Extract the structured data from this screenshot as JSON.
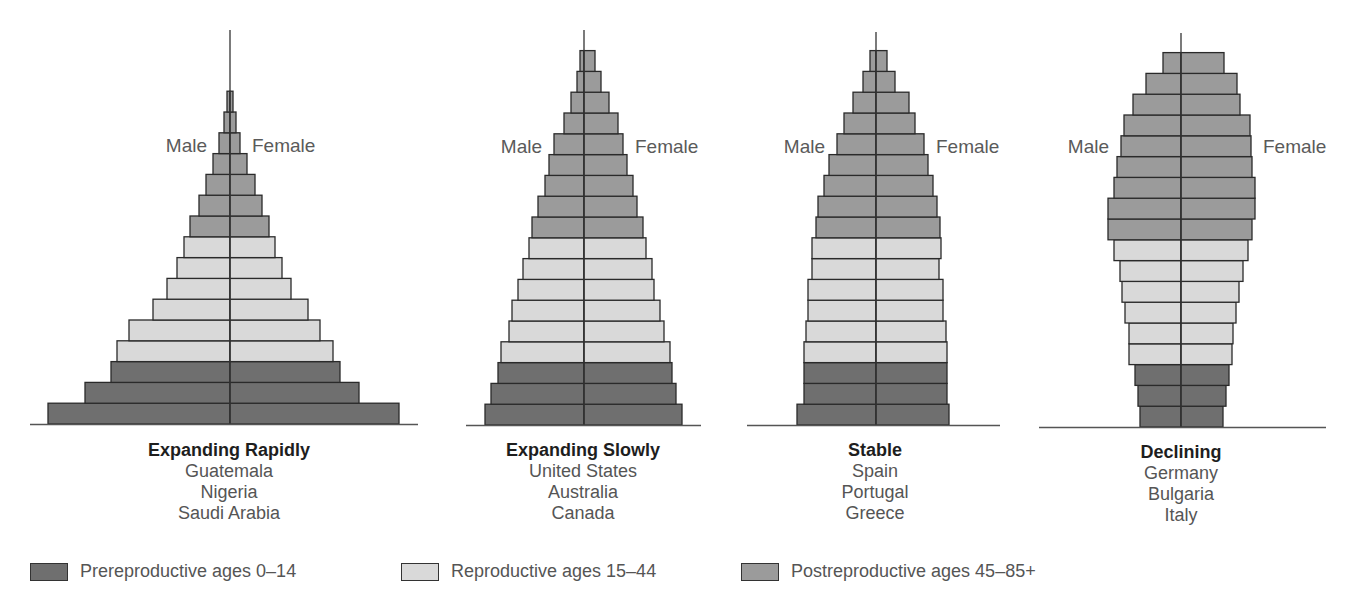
{
  "colors": {
    "prereproductive": "#6f6f6f",
    "reproductive": "#d9d9d9",
    "postreproductive": "#9b9b9b",
    "outline": "#2a2a2a",
    "axis": "#333333"
  },
  "labels": {
    "male": "Male",
    "female": "Female"
  },
  "legend": [
    {
      "key": "prereproductive",
      "label": "Prereproductive ages 0–14"
    },
    {
      "key": "reproductive",
      "label": "Reproductive ages 15–44"
    },
    {
      "key": "postreproductive",
      "label": "Postreproductive ages 45–85+"
    }
  ],
  "pyramids": [
    {
      "title": "Expanding Rapidly",
      "countries": [
        "Guatemala",
        "Nigeria",
        "Saudi Arabia"
      ]
    },
    {
      "title": "Expanding Slowly",
      "countries": [
        "United States",
        "Australia",
        "Canada"
      ]
    },
    {
      "title": "Stable",
      "countries": [
        "Spain",
        "Portugal",
        "Greece"
      ]
    },
    {
      "title": "Declining",
      "countries": [
        "Germany",
        "Bulgaria",
        "Italy"
      ]
    }
  ],
  "chart_data": {
    "type": "bar",
    "subtype": "population-pyramid",
    "note": "Bars listed bottom (youngest) to top (oldest); values are relative bar half-widths in px (male, female) read from the figure; no numeric axis shown.",
    "legend_position": "bottom",
    "grid": false,
    "series": [
      {
        "name": "Expanding Rapidly",
        "countries": [
          "Guatemala",
          "Nigeria",
          "Saudi Arabia"
        ],
        "axis_x": 230,
        "base_y": 424,
        "axis_top": 30,
        "baseline": [
          30,
          418
        ],
        "groups": [
          "pre",
          "pre",
          "pre",
          "rep",
          "rep",
          "rep",
          "rep",
          "rep",
          "rep",
          "post",
          "post",
          "post",
          "post",
          "post",
          "post",
          "post"
        ],
        "male": [
          182,
          145,
          119,
          113,
          101,
          77,
          63,
          53,
          46,
          40,
          31,
          24,
          17,
          11,
          6,
          3
        ],
        "female": [
          169,
          129,
          110,
          103,
          90,
          78,
          61,
          52,
          45,
          39,
          32,
          25,
          17,
          10,
          6,
          3
        ],
        "label_y": 152
      },
      {
        "name": "Expanding Slowly",
        "countries": [
          "United States",
          "Australia",
          "Canada"
        ],
        "axis_x": 584,
        "base_y": 425,
        "axis_top": 30,
        "baseline": [
          466,
          701
        ],
        "groups": [
          "pre",
          "pre",
          "pre",
          "rep",
          "rep",
          "rep",
          "rep",
          "rep",
          "rep",
          "post",
          "post",
          "post",
          "post",
          "post",
          "post",
          "post",
          "post",
          "post"
        ],
        "male": [
          99,
          93,
          86,
          83,
          75,
          72,
          66,
          61,
          55,
          52,
          46,
          39,
          35,
          30,
          20,
          13,
          7,
          4
        ],
        "female": [
          98,
          92,
          88,
          86,
          80,
          76,
          70,
          68,
          62,
          59,
          53,
          49,
          43,
          39,
          34,
          25,
          17,
          11
        ],
        "label_y": 153
      },
      {
        "name": "Stable",
        "countries": [
          "Spain",
          "Portugal",
          "Greece"
        ],
        "axis_x": 876,
        "base_y": 425,
        "axis_top": 32,
        "baseline": [
          747,
          1000
        ],
        "groups": [
          "pre",
          "pre",
          "pre",
          "rep",
          "rep",
          "rep",
          "rep",
          "rep",
          "rep",
          "post",
          "post",
          "post",
          "post",
          "post",
          "post",
          "post",
          "post",
          "post"
        ],
        "male": [
          79,
          72,
          72,
          72,
          70,
          68,
          68,
          64,
          64,
          60,
          58,
          52,
          47,
          39,
          32,
          23,
          13,
          6
        ],
        "female": [
          73,
          71,
          71,
          71,
          70,
          67,
          67,
          63,
          65,
          64,
          61,
          57,
          52,
          48,
          39,
          33,
          19,
          11
        ],
        "label_y": 153
      },
      {
        "name": "Declining",
        "countries": [
          "Germany",
          "Bulgaria",
          "Italy"
        ],
        "axis_x": 1181,
        "base_y": 427,
        "axis_top": 33,
        "baseline": [
          1039,
          1326
        ],
        "groups": [
          "pre",
          "pre",
          "pre",
          "rep",
          "rep",
          "rep",
          "rep",
          "rep",
          "rep",
          "post",
          "post",
          "post",
          "post",
          "post",
          "post",
          "post",
          "post",
          "post"
        ],
        "male": [
          41,
          43,
          46,
          52,
          52,
          56,
          59,
          61,
          67,
          73,
          73,
          67,
          64,
          60,
          57,
          48,
          35,
          18
        ],
        "female": [
          42,
          45,
          48,
          51,
          52,
          55,
          58,
          62,
          67,
          71,
          74,
          74,
          71,
          70,
          69,
          59,
          56,
          43
        ],
        "label_y": 153
      }
    ]
  }
}
